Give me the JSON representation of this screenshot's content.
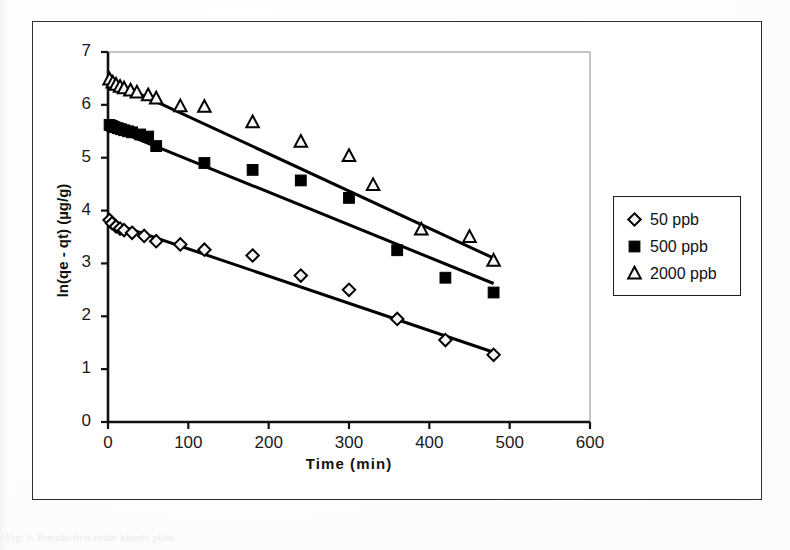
{
  "figure": {
    "caption_faint": "Fig. 4.  Pseudo-first-order kinetic plots"
  },
  "chart_data": {
    "type": "scatter",
    "title": "",
    "xlabel": "Time (min)",
    "ylabel": "ln(qe - qt) (µg/g)",
    "xlim": [
      0,
      600
    ],
    "ylim": [
      0,
      7
    ],
    "xticks": [
      0,
      100,
      200,
      300,
      400,
      500,
      600
    ],
    "yticks": [
      0,
      1,
      2,
      3,
      4,
      5,
      6,
      7
    ],
    "grid": false,
    "legend_position": "right-outside",
    "series": [
      {
        "name": "50 ppb",
        "marker": "open-diamond",
        "color": "#000000",
        "points": [
          {
            "x": 2,
            "y": 3.82
          },
          {
            "x": 5,
            "y": 3.76
          },
          {
            "x": 10,
            "y": 3.7
          },
          {
            "x": 15,
            "y": 3.66
          },
          {
            "x": 20,
            "y": 3.63
          },
          {
            "x": 30,
            "y": 3.58
          },
          {
            "x": 45,
            "y": 3.52
          },
          {
            "x": 60,
            "y": 3.42
          },
          {
            "x": 90,
            "y": 3.36
          },
          {
            "x": 120,
            "y": 3.26
          },
          {
            "x": 180,
            "y": 3.15
          },
          {
            "x": 240,
            "y": 2.77
          },
          {
            "x": 300,
            "y": 2.5
          },
          {
            "x": 360,
            "y": 1.95
          },
          {
            "x": 420,
            "y": 1.55
          },
          {
            "x": 480,
            "y": 1.27
          }
        ],
        "trendline": {
          "x0": 2,
          "y0": 3.78,
          "x1": 480,
          "y1": 1.32
        }
      },
      {
        "name": "500 ppb",
        "marker": "filled-square",
        "color": "#000000",
        "points": [
          {
            "x": 2,
            "y": 5.62
          },
          {
            "x": 5,
            "y": 5.6
          },
          {
            "x": 8,
            "y": 5.58
          },
          {
            "x": 12,
            "y": 5.56
          },
          {
            "x": 16,
            "y": 5.54
          },
          {
            "x": 20,
            "y": 5.52
          },
          {
            "x": 25,
            "y": 5.5
          },
          {
            "x": 30,
            "y": 5.48
          },
          {
            "x": 40,
            "y": 5.44
          },
          {
            "x": 50,
            "y": 5.4
          },
          {
            "x": 60,
            "y": 5.22
          },
          {
            "x": 120,
            "y": 4.9
          },
          {
            "x": 180,
            "y": 4.77
          },
          {
            "x": 240,
            "y": 4.57
          },
          {
            "x": 300,
            "y": 4.24
          },
          {
            "x": 360,
            "y": 3.25
          },
          {
            "x": 420,
            "y": 2.73
          },
          {
            "x": 480,
            "y": 2.45
          }
        ],
        "trendline": {
          "x0": 2,
          "y0": 5.57,
          "x1": 480,
          "y1": 2.62
        }
      },
      {
        "name": "2000 ppb",
        "marker": "open-triangle",
        "color": "#000000",
        "points": [
          {
            "x": 2,
            "y": 6.48
          },
          {
            "x": 6,
            "y": 6.42
          },
          {
            "x": 10,
            "y": 6.38
          },
          {
            "x": 15,
            "y": 6.34
          },
          {
            "x": 20,
            "y": 6.31
          },
          {
            "x": 28,
            "y": 6.27
          },
          {
            "x": 36,
            "y": 6.23
          },
          {
            "x": 50,
            "y": 6.18
          },
          {
            "x": 60,
            "y": 6.12
          },
          {
            "x": 90,
            "y": 5.97
          },
          {
            "x": 120,
            "y": 5.96
          },
          {
            "x": 180,
            "y": 5.67
          },
          {
            "x": 240,
            "y": 5.3
          },
          {
            "x": 300,
            "y": 5.03
          },
          {
            "x": 330,
            "y": 4.48
          },
          {
            "x": 390,
            "y": 3.64
          },
          {
            "x": 450,
            "y": 3.5
          },
          {
            "x": 480,
            "y": 3.05
          }
        ],
        "trendline": {
          "x0": 2,
          "y0": 6.47,
          "x1": 480,
          "y1": 3.1
        }
      }
    ]
  },
  "legend": {
    "items": [
      {
        "label": "50 ppb",
        "marker": "open-diamond"
      },
      {
        "label": "500 ppb",
        "marker": "filled-square"
      },
      {
        "label": "2000 ppb",
        "marker": "open-triangle"
      }
    ]
  }
}
